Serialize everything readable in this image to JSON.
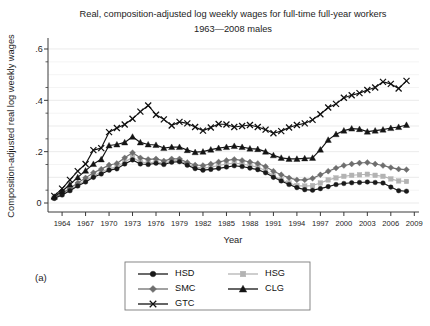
{
  "figure": {
    "panel_label": "(a)",
    "title_line1": "Real, composition-adjusted log weekly wages for full-time full-year workers",
    "title_line2": "1963—2008 males"
  },
  "axes": {
    "xlabel": "Year",
    "ylabel": "Composition-adjusted real log weekly wages",
    "x_ticks": [
      "1964",
      "1967",
      "1970",
      "1973",
      "1976",
      "1979",
      "1982",
      "1985",
      "1988",
      "1991",
      "1994",
      "1997",
      "2000",
      "2003",
      "2006",
      "2009"
    ],
    "y_ticks": [
      "0",
      ".2",
      ".4",
      ".6"
    ],
    "xlim": [
      1962.2,
      2009.6
    ],
    "ylim": [
      -0.035,
      0.635
    ],
    "grid": "horizontal"
  },
  "legend": {
    "position": "below-plot-center",
    "entries": [
      {
        "label": "HSD",
        "marker": "circle",
        "color": "#1a1a1a"
      },
      {
        "label": "HSG",
        "marker": "square",
        "color": "#b3b3b3"
      },
      {
        "label": "SMC",
        "marker": "diamond",
        "color": "#6e6e6e"
      },
      {
        "label": "CLG",
        "marker": "triangle",
        "color": "#141414"
      },
      {
        "label": "GTC",
        "marker": "x",
        "color": "#111111"
      }
    ]
  },
  "chart_data": {
    "type": "line",
    "title": "Real, composition-adjusted log weekly wages for full-time full-year workers 1963—2008 males",
    "xlabel": "Year",
    "ylabel": "Composition-adjusted real log weekly wages",
    "xlim": [
      1962.2,
      2009.6
    ],
    "ylim": [
      -0.035,
      0.635
    ],
    "grid": true,
    "legend_position": "below",
    "x": [
      1963,
      1964,
      1965,
      1966,
      1967,
      1968,
      1969,
      1970,
      1971,
      1972,
      1973,
      1974,
      1975,
      1976,
      1977,
      1978,
      1979,
      1980,
      1981,
      1982,
      1983,
      1984,
      1985,
      1986,
      1987,
      1988,
      1989,
      1990,
      1991,
      1992,
      1993,
      1994,
      1995,
      1996,
      1997,
      1998,
      1999,
      2000,
      2001,
      2002,
      2003,
      2004,
      2005,
      2006,
      2007,
      2008
    ],
    "series": [
      {
        "name": "HSD",
        "marker": "circle",
        "color": "#1a1a1a",
        "values": [
          0.018,
          0.031,
          0.048,
          0.066,
          0.082,
          0.1,
          0.113,
          0.128,
          0.133,
          0.152,
          0.168,
          0.152,
          0.15,
          0.155,
          0.15,
          0.159,
          0.161,
          0.147,
          0.134,
          0.128,
          0.131,
          0.135,
          0.14,
          0.145,
          0.142,
          0.136,
          0.13,
          0.118,
          0.1,
          0.086,
          0.072,
          0.06,
          0.052,
          0.05,
          0.056,
          0.064,
          0.072,
          0.076,
          0.079,
          0.08,
          0.082,
          0.08,
          0.078,
          0.062,
          0.048,
          0.046
        ]
      },
      {
        "name": "HSG",
        "marker": "square",
        "color": "#b3b3b3",
        "values": [
          0.02,
          0.034,
          0.052,
          0.07,
          0.088,
          0.106,
          0.12,
          0.134,
          0.14,
          0.16,
          0.178,
          0.16,
          0.156,
          0.16,
          0.155,
          0.164,
          0.166,
          0.152,
          0.14,
          0.136,
          0.14,
          0.146,
          0.152,
          0.156,
          0.152,
          0.146,
          0.14,
          0.126,
          0.106,
          0.09,
          0.078,
          0.068,
          0.066,
          0.068,
          0.078,
          0.09,
          0.098,
          0.104,
          0.108,
          0.11,
          0.112,
          0.108,
          0.104,
          0.094,
          0.086,
          0.084
        ]
      },
      {
        "name": "SMC",
        "marker": "diamond",
        "color": "#6e6e6e",
        "values": [
          0.022,
          0.038,
          0.058,
          0.078,
          0.098,
          0.118,
          0.132,
          0.148,
          0.154,
          0.176,
          0.196,
          0.176,
          0.17,
          0.172,
          0.164,
          0.172,
          0.172,
          0.158,
          0.148,
          0.146,
          0.152,
          0.16,
          0.166,
          0.17,
          0.166,
          0.16,
          0.154,
          0.142,
          0.124,
          0.11,
          0.098,
          0.09,
          0.09,
          0.096,
          0.11,
          0.124,
          0.136,
          0.146,
          0.152,
          0.156,
          0.158,
          0.152,
          0.146,
          0.138,
          0.132,
          0.13
        ]
      },
      {
        "name": "CLG",
        "marker": "triangle",
        "color": "#141414",
        "values": [
          0.024,
          0.046,
          0.072,
          0.1,
          0.126,
          0.152,
          0.17,
          0.224,
          0.228,
          0.236,
          0.258,
          0.236,
          0.228,
          0.226,
          0.214,
          0.218,
          0.218,
          0.206,
          0.198,
          0.2,
          0.208,
          0.214,
          0.218,
          0.222,
          0.218,
          0.212,
          0.21,
          0.2,
          0.186,
          0.176,
          0.172,
          0.172,
          0.174,
          0.176,
          0.208,
          0.246,
          0.268,
          0.282,
          0.29,
          0.288,
          0.278,
          0.282,
          0.286,
          0.292,
          0.296,
          0.304
        ]
      },
      {
        "name": "GTC",
        "marker": "x",
        "color": "#111111",
        "values": [
          0.028,
          0.056,
          0.09,
          0.124,
          0.152,
          0.206,
          0.214,
          0.276,
          0.292,
          0.306,
          0.328,
          0.356,
          0.38,
          0.344,
          0.326,
          0.302,
          0.316,
          0.31,
          0.296,
          0.282,
          0.294,
          0.308,
          0.306,
          0.296,
          0.3,
          0.304,
          0.296,
          0.286,
          0.272,
          0.28,
          0.294,
          0.304,
          0.31,
          0.324,
          0.346,
          0.372,
          0.386,
          0.41,
          0.42,
          0.428,
          0.44,
          0.45,
          0.472,
          0.464,
          0.446,
          0.476
        ]
      }
    ]
  }
}
